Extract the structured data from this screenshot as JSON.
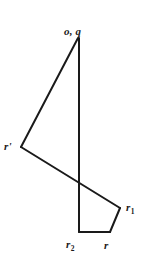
{
  "figure": {
    "background_color": "#ffffff",
    "stroke_color": "#1a1a1a",
    "stroke_width": 2,
    "width": 152,
    "height": 265,
    "labels": {
      "apex": "o, q",
      "left_vertex": "r'",
      "right_vertex_base": "r",
      "right_vertex_sub": "1",
      "bottom_left_base": "r",
      "bottom_left_sub": "2",
      "bottom_right": "r"
    },
    "vertices": {
      "apex": [
        78,
        38
      ],
      "left": [
        21,
        147
      ],
      "bottom_left": [
        79,
        232
      ],
      "bottom_right": [
        110,
        232
      ],
      "right": [
        120,
        208
      ],
      "crossing": [
        79,
        180
      ]
    },
    "segments": [
      {
        "name": "apex-to-left",
        "from": [
          78,
          38
        ],
        "to": [
          21,
          147
        ]
      },
      {
        "name": "apex-to-bottom-left",
        "from": [
          79,
          38
        ],
        "to": [
          79,
          232
        ]
      },
      {
        "name": "left-to-right",
        "from": [
          21,
          147
        ],
        "to": [
          120,
          208
        ]
      },
      {
        "name": "right-to-bottom-right",
        "from": [
          120,
          208
        ],
        "to": [
          110,
          232
        ]
      },
      {
        "name": "bottom-right-to-bottom-left",
        "from": [
          110,
          232
        ],
        "to": [
          79,
          232
        ]
      }
    ]
  }
}
